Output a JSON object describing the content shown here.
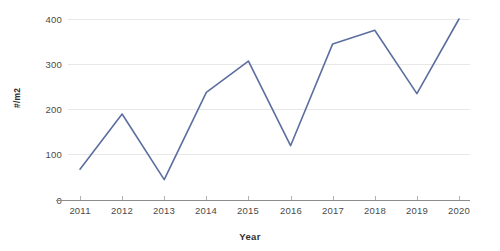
{
  "chart_data": {
    "type": "line",
    "title": "",
    "subtitle": "",
    "xlabel": "Year",
    "ylabel": "#/m2",
    "categories": [
      "2011",
      "2012",
      "2013",
      "2014",
      "2015",
      "2016",
      "2017",
      "2018",
      "2019",
      "2020"
    ],
    "x": [
      2011,
      2012,
      2013,
      2014,
      2015,
      2016,
      2017,
      2018,
      2019,
      2020
    ],
    "values": [
      68,
      190,
      45,
      238,
      307,
      120,
      345,
      375,
      235,
      400
    ],
    "series": [
      {
        "name": "#/m2",
        "values": [
          68,
          190,
          45,
          238,
          307,
          120,
          345,
          375,
          235,
          400
        ],
        "color": "#5b6e9e"
      }
    ],
    "ylim": [
      0,
      400
    ],
    "yticks": [
      0,
      100,
      200,
      300,
      400
    ],
    "ytick_labels": [
      "0",
      "100",
      "200",
      "300",
      "400"
    ],
    "grid": true,
    "grid_axis": "y",
    "legend": false,
    "legend_position": "none",
    "markers": false,
    "line_width": 1.6,
    "background": "#ffffff",
    "grid_color": "#e8e8e8",
    "axis_color": "#8d8d8d",
    "tick_label_color": "#4a4a4a"
  }
}
